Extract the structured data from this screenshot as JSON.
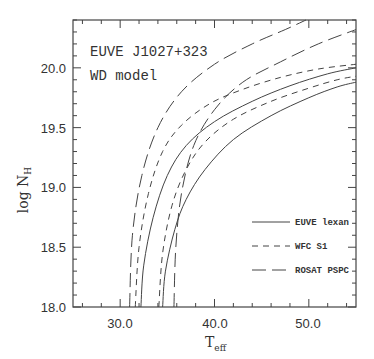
{
  "chart_data": {
    "type": "line",
    "title": "",
    "annotations": [
      "EUVE J1027+323",
      "WD model"
    ],
    "xlabel": "T_eff",
    "ylabel": "log N_H",
    "xlim": [
      25,
      55
    ],
    "ylim": [
      18.0,
      20.4
    ],
    "xticks": [
      30.0,
      40.0,
      50.0
    ],
    "xtick_labels": [
      "30.0",
      "40.0",
      "50.0"
    ],
    "yticks": [
      18.0,
      18.5,
      19.0,
      19.5,
      20.0
    ],
    "ytick_labels": [
      "18.0",
      "18.5",
      "19.0",
      "19.5",
      "20.0"
    ],
    "grid": false,
    "legend_position": "lower right",
    "legend": [
      {
        "label": "EUVE lexan",
        "style": "solid"
      },
      {
        "label": "WFC S1",
        "style": "short-dash"
      },
      {
        "label": "ROSAT PSPC",
        "style": "long-dash"
      }
    ],
    "series": [
      {
        "name": "EUVE lexan (upper)",
        "style": "solid",
        "x": [
          32.2,
          32.5,
          33.5,
          35.0,
          37.0,
          40.0,
          44.0,
          48.0,
          52.0,
          55.0
        ],
        "y": [
          18.0,
          18.35,
          18.75,
          19.1,
          19.35,
          19.55,
          19.72,
          19.85,
          19.95,
          20.0
        ]
      },
      {
        "name": "EUVE lexan (lower)",
        "style": "solid",
        "x": [
          34.5,
          34.8,
          35.8,
          37.0,
          39.0,
          42.0,
          46.0,
          50.0,
          53.0,
          55.0
        ],
        "y": [
          18.0,
          18.3,
          18.65,
          18.9,
          19.15,
          19.4,
          19.6,
          19.75,
          19.84,
          19.88
        ]
      },
      {
        "name": "WFC S1 (upper)",
        "style": "short-dash",
        "x": [
          31.6,
          32.0,
          33.0,
          34.5,
          36.5,
          39.5,
          43.0,
          47.0,
          51.0,
          55.0
        ],
        "y": [
          18.0,
          18.5,
          18.95,
          19.3,
          19.52,
          19.7,
          19.82,
          19.92,
          19.99,
          20.03
        ]
      },
      {
        "name": "WFC S1 (lower)",
        "style": "short-dash",
        "x": [
          34.1,
          34.5,
          35.5,
          37.0,
          39.0,
          42.0,
          46.0,
          50.0,
          53.0,
          55.0
        ],
        "y": [
          18.0,
          18.45,
          18.85,
          19.15,
          19.38,
          19.57,
          19.72,
          19.83,
          19.9,
          19.93
        ]
      },
      {
        "name": "ROSAT PSPC (upper)",
        "style": "long-dash",
        "x": [
          31.0,
          31.3,
          32.3,
          34.0,
          36.5,
          40.0,
          44.0,
          47.5,
          49.7
        ],
        "y": [
          18.0,
          18.6,
          19.1,
          19.5,
          19.8,
          20.03,
          20.2,
          20.32,
          20.4
        ]
      },
      {
        "name": "ROSAT PSPC (lower)",
        "style": "long-dash",
        "x": [
          35.7,
          35.9,
          36.5,
          37.8,
          40.0,
          43.0,
          47.0,
          51.0,
          55.0
        ],
        "y": [
          18.0,
          18.5,
          18.95,
          19.35,
          19.65,
          19.88,
          20.05,
          20.2,
          20.32
        ]
      }
    ]
  },
  "annotations": {
    "line1": "EUVE J1027+323",
    "line2": "WD model"
  },
  "axes": {
    "xlabel_main": "T",
    "xlabel_sub": "eff",
    "ylabel_main": "log N",
    "ylabel_sub": "H",
    "xtick_labels": [
      "30.0",
      "40.0",
      "50.0"
    ],
    "ytick_labels": [
      "18.0",
      "18.5",
      "19.0",
      "19.5",
      "20.0"
    ]
  },
  "legend": {
    "items": [
      {
        "label": "EUVE lexan"
      },
      {
        "label": "WFC S1"
      },
      {
        "label": "ROSAT PSPC"
      }
    ]
  }
}
